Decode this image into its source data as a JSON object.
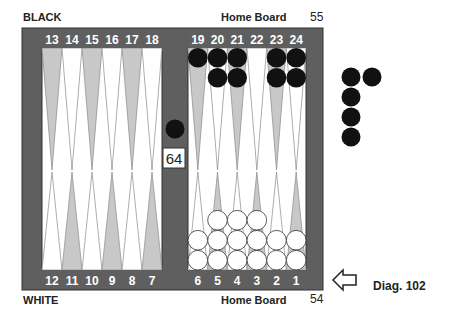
{
  "labels": {
    "top_player": "BLACK",
    "bottom_player": "WHITE",
    "top_home": "Home Board",
    "bottom_home": "Home Board",
    "top_pipcount": "55",
    "bottom_pipcount": "54",
    "diagram_caption": "Diag. 102"
  },
  "board": {
    "top_points": [
      "13",
      "14",
      "15",
      "16",
      "17",
      "18",
      "19",
      "20",
      "21",
      "22",
      "23",
      "24"
    ],
    "bottom_points": [
      "12",
      "11",
      "10",
      "9",
      "8",
      "7",
      "6",
      "5",
      "4",
      "3",
      "2",
      "1"
    ],
    "cube_value": "64",
    "colors": {
      "frame": "#5f5f5f",
      "inner": "#ffffff",
      "dark_point": "#c8c8c8",
      "light_point": "#ffffff",
      "black_checker": "#111111",
      "white_checker": "#ffffff",
      "number": "#ffffff"
    },
    "black_checkers": [
      {
        "point": "19",
        "count": 1
      },
      {
        "point": "20",
        "count": 2
      },
      {
        "point": "21",
        "count": 2
      },
      {
        "point": "23",
        "count": 2
      },
      {
        "point": "24",
        "count": 2
      },
      {
        "point": "bar",
        "count": 1
      }
    ],
    "white_checkers": [
      {
        "point": "6",
        "count": 2
      },
      {
        "point": "5",
        "count": 3
      },
      {
        "point": "4",
        "count": 3
      },
      {
        "point": "3",
        "count": 3
      },
      {
        "point": "2",
        "count": 2
      },
      {
        "point": "1",
        "count": 2
      }
    ],
    "borne_off_black": 5,
    "turn_indicator": "arrow-pointing-left"
  }
}
